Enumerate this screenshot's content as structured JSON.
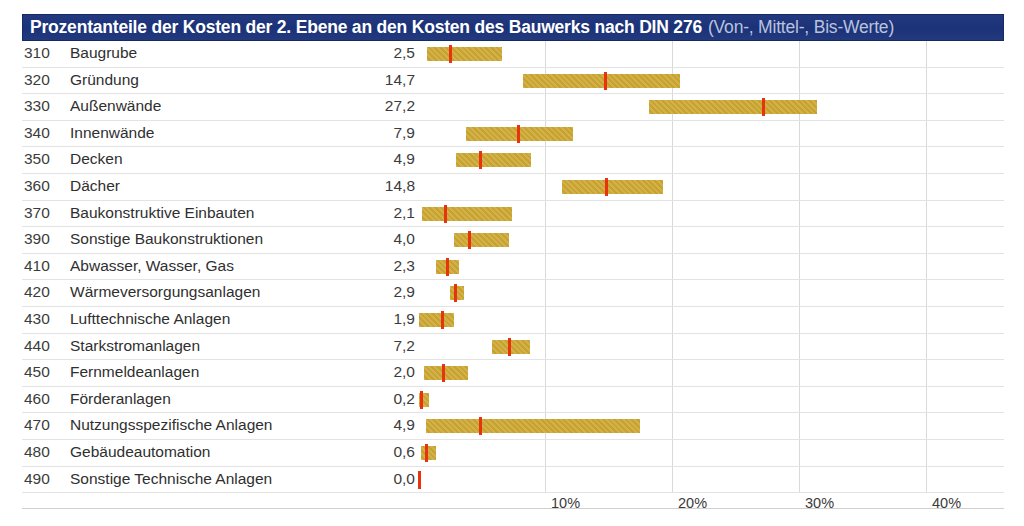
{
  "title": {
    "main": "Prozentanteile der Kosten der 2. Ebene an den Kosten des Bauwerks nach DIN 276",
    "sub": "(Von-, Mittel-, Bis-Werte)"
  },
  "colors": {
    "header_bg": "#1f3f8f",
    "header_text": "#ffffff",
    "header_subtext": "#b9c3dd",
    "bar": "#c8a22b",
    "marker": "#e8340c",
    "gridline": "#d9d9d9"
  },
  "chart_data": {
    "type": "bar",
    "title": "Prozentanteile der Kosten der 2. Ebene an den Kosten des Bauwerks nach DIN 276 (Von-, Mittel-, Bis-Werte)",
    "xlabel": "",
    "ylabel": "",
    "xlim": [
      0,
      46.1
    ],
    "grid": true,
    "orientation": "horizontal",
    "value_kind": "range-with-mean",
    "tick_labels": [
      "10%",
      "20%",
      "30%",
      "40%"
    ],
    "tick_values": [
      10,
      20,
      30,
      40
    ],
    "columns": [
      "Kostengruppe",
      "Bezeichnung",
      "Mittelwert"
    ],
    "rows": [
      {
        "code": "310",
        "name": "Baugrube",
        "value": "2,5",
        "von": 0.7,
        "mittel": 2.5,
        "bis": 6.6
      },
      {
        "code": "320",
        "name": "Gründung",
        "value": "14,7",
        "von": 8.3,
        "mittel": 14.7,
        "bis": 20.6
      },
      {
        "code": "330",
        "name": "Außenwände",
        "value": "27,2",
        "von": 18.2,
        "mittel": 27.2,
        "bis": 31.4
      },
      {
        "code": "340",
        "name": "Innenwände",
        "value": "7,9",
        "von": 3.8,
        "mittel": 7.9,
        "bis": 12.2
      },
      {
        "code": "350",
        "name": "Decken",
        "value": "4,9",
        "von": 3.0,
        "mittel": 4.9,
        "bis": 8.9
      },
      {
        "code": "360",
        "name": "Dächer",
        "value": "14,8",
        "von": 11.3,
        "mittel": 14.8,
        "bis": 19.3
      },
      {
        "code": "370",
        "name": "Baukonstruktive Einbauten",
        "value": "2,1",
        "von": 0.3,
        "mittel": 2.1,
        "bis": 7.4
      },
      {
        "code": "390",
        "name": "Sonstige Baukonstruktionen",
        "value": "4,0",
        "von": 2.8,
        "mittel": 4.0,
        "bis": 7.2
      },
      {
        "code": "410",
        "name": "Abwasser, Wasser, Gas",
        "value": "2,3",
        "von": 1.4,
        "mittel": 2.3,
        "bis": 3.2
      },
      {
        "code": "420",
        "name": "Wärmeversorgungsanlagen",
        "value": "2,9",
        "von": 2.5,
        "mittel": 2.9,
        "bis": 3.6
      },
      {
        "code": "430",
        "name": "Lufttechnische Anlagen",
        "value": "1,9",
        "von": 0.1,
        "mittel": 1.9,
        "bis": 2.8
      },
      {
        "code": "440",
        "name": "Starkstromanlagen",
        "value": "7,2",
        "von": 5.8,
        "mittel": 7.2,
        "bis": 8.8
      },
      {
        "code": "450",
        "name": "Fernmeldeanlagen",
        "value": "2,0",
        "von": 0.5,
        "mittel": 2.0,
        "bis": 3.9
      },
      {
        "code": "460",
        "name": "Förderanlagen",
        "value": "0,2",
        "von": 0.1,
        "mittel": 0.2,
        "bis": 0.9
      },
      {
        "code": "470",
        "name": "Nutzungsspezifische Anlagen",
        "value": "4,9",
        "von": 0.6,
        "mittel": 4.9,
        "bis": 17.5
      },
      {
        "code": "480",
        "name": "Gebäudeautomation",
        "value": "0,6",
        "von": 0.2,
        "mittel": 0.6,
        "bis": 1.4
      },
      {
        "code": "490",
        "name": "Sonstige Technische Anlagen",
        "value": "0,0",
        "von": 0.0,
        "mittel": 0.0,
        "bis": 0.0
      }
    ]
  }
}
